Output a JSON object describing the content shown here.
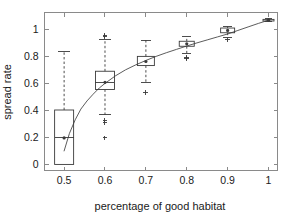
{
  "figure": {
    "background": "#ffffff",
    "axis_color": "#8a8a8a",
    "data_color": "#3a3a3a",
    "curve_color": "#4a4a4a"
  },
  "axes": {
    "xlabel": "percentage of good habitat",
    "ylabel": "spread rate",
    "x_ticks": [
      "0.5",
      "0.6",
      "0.7",
      "0.8",
      "0.9",
      "1"
    ],
    "y_ticks": [
      "0",
      "0.2",
      "0.4",
      "0.6",
      "0.8",
      "1"
    ],
    "xlim": [
      0.452,
      1.022
    ],
    "ylim": [
      -0.045,
      1.125
    ],
    "grid": "off",
    "box": "on"
  },
  "chart_data": {
    "type": "box",
    "title": "",
    "xlabel": "percentage of good habitat",
    "ylabel": "spread rate",
    "xlim": [
      0.452,
      1.022
    ],
    "ylim": [
      -0.045,
      1.125
    ],
    "x_ticks": [
      0.5,
      0.6,
      0.7,
      0.8,
      0.9,
      1.0
    ],
    "y_ticks": [
      0,
      0.2,
      0.4,
      0.6,
      0.8,
      1.0
    ],
    "grid": false,
    "legend": "none",
    "categories": [
      0.5,
      0.6,
      0.7,
      0.8,
      0.9,
      1.0
    ],
    "boxes": [
      {
        "x": 0.5,
        "median": 0.196,
        "q1": 0.0,
        "q3": 0.403,
        "whisker_low": 0.0,
        "whisker_high": 0.838,
        "outliers": []
      },
      {
        "x": 0.6,
        "median": 0.608,
        "q1": 0.555,
        "q3": 0.69,
        "whisker_low": 0.368,
        "whisker_high": 0.925,
        "outliers": [
          0.955,
          0.945,
          0.325,
          0.313,
          0.196
        ]
      },
      {
        "x": 0.7,
        "median": 0.762,
        "q1": 0.732,
        "q3": 0.8,
        "whisker_low": 0.605,
        "whisker_high": 0.92,
        "outliers": [
          0.53
        ]
      },
      {
        "x": 0.8,
        "median": 0.893,
        "q1": 0.875,
        "q3": 0.912,
        "whisker_low": 0.818,
        "whisker_high": 0.945,
        "outliers": [
          0.793,
          0.782
        ]
      },
      {
        "x": 0.9,
        "median": 0.992,
        "q1": 0.975,
        "q3": 1.01,
        "whisker_low": 0.938,
        "whisker_high": 1.022,
        "outliers": [
          0.922
        ]
      },
      {
        "x": 1.0,
        "median": 1.068,
        "q1": 1.062,
        "q3": 1.074,
        "whisker_low": 1.055,
        "whisker_high": 1.08,
        "outliers": []
      }
    ],
    "fit_curve": {
      "name": "fitted spread rate",
      "x": [
        0.5,
        0.513,
        0.527,
        0.541,
        0.556,
        0.571,
        0.586,
        0.6,
        0.625,
        0.65,
        0.675,
        0.7,
        0.725,
        0.75,
        0.775,
        0.8,
        0.825,
        0.85,
        0.875,
        0.9,
        0.925,
        0.95,
        0.975,
        1.0
      ],
      "y": [
        0.1,
        0.23,
        0.33,
        0.41,
        0.47,
        0.52,
        0.566,
        0.6,
        0.655,
        0.7,
        0.737,
        0.77,
        0.8,
        0.827,
        0.852,
        0.877,
        0.9,
        0.922,
        0.944,
        0.966,
        0.992,
        1.018,
        1.044,
        1.068
      ]
    }
  }
}
